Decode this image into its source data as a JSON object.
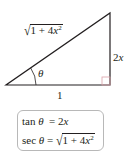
{
  "figure": {
    "type": "right-triangle",
    "vertices": {
      "bottom_left": [
        6,
        85
      ],
      "bottom_right": [
        110,
        85
      ],
      "top_right": [
        110,
        13
      ]
    },
    "colors": {
      "stroke": "#231f20",
      "right_angle_marker": "#d9a0a8",
      "box_border": "#b8b8b8"
    },
    "labels": {
      "hypotenuse": {
        "radicand_1": "1 + 4",
        "var": "x",
        "exp": "2"
      },
      "opposite": {
        "coef": "2",
        "var": "x"
      },
      "adjacent": "1",
      "angle": "θ"
    }
  },
  "identity_box": {
    "rows": [
      {
        "lhs": "tan",
        "theta": "θ",
        "eq": "=",
        "rhs_coef": "2",
        "rhs_var": "x"
      },
      {
        "lhs": "sec",
        "theta": "θ",
        "eq": "=",
        "rhs_radicand": "1 + 4",
        "rhs_var": "x",
        "rhs_exp": "2"
      }
    ]
  }
}
